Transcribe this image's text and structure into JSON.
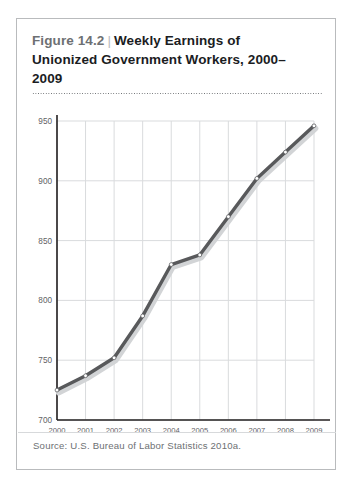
{
  "figure": {
    "number": "Figure 14.2",
    "separator": "|",
    "title_line1": "Weekly Earnings of",
    "title_line2": "Unionized Government Workers, 2000–",
    "title_line3": "2009",
    "source": "Source: U.S. Bureau of Labor Statistics 2010a."
  },
  "colors": {
    "line": "#58595b",
    "line_shadow": "#d2d4d6",
    "marker_fill": "#ffffff",
    "marker_stroke": "#58595b",
    "grid": "#d9dbdd",
    "axis": "#231f20",
    "border": "#b9bbbd",
    "tick_text": "#5f6265",
    "fig_number_text": "#6d7073",
    "title_text": "#1b1d1f"
  },
  "chart_data": {
    "type": "line",
    "xlabel": "",
    "ylabel": "",
    "x": [
      2000,
      2001,
      2002,
      2003,
      2004,
      2005,
      2006,
      2007,
      2008,
      2009
    ],
    "categories": [
      "2000",
      "2001",
      "2002",
      "2003",
      "2004",
      "2005",
      "2006",
      "2007",
      "2008",
      "2009"
    ],
    "values": [
      725,
      737,
      752,
      787,
      830,
      838,
      870,
      902,
      924,
      946
    ],
    "series": [
      {
        "name": "Weekly earnings",
        "values": [
          725,
          737,
          752,
          787,
          830,
          838,
          870,
          902,
          924,
          946
        ]
      }
    ],
    "ylim": [
      700,
      950
    ],
    "yticks": [
      700,
      750,
      800,
      850,
      900,
      950
    ],
    "ytick_labels": [
      "700",
      "750",
      "800",
      "850",
      "900",
      "950"
    ],
    "xticks": [
      2000,
      2001,
      2002,
      2003,
      2004,
      2005,
      2006,
      2007,
      2008,
      2009
    ],
    "xtick_labels": [
      "2000",
      "2001",
      "2002",
      "2003",
      "2004",
      "2005",
      "2006",
      "2007",
      "2008",
      "2009"
    ],
    "grid": true,
    "grid_axis": "both",
    "legend": false,
    "legend_position": "none",
    "markers": "circle-open"
  }
}
